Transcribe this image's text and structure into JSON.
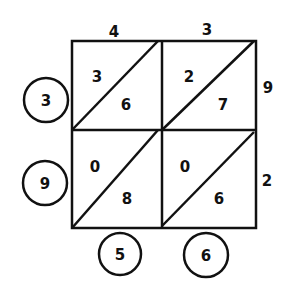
{
  "diagram": {
    "type": "lattice-multiplication",
    "top_digits": [
      "4",
      "3"
    ],
    "left_digits": [
      "3",
      "9"
    ],
    "right_labels": [
      "9",
      "2"
    ],
    "cells": [
      [
        {
          "tens": "3",
          "ones": "6"
        },
        {
          "tens": "2",
          "ones": "7"
        }
      ],
      [
        {
          "tens": "0",
          "ones": "8"
        },
        {
          "tens": "0",
          "ones": "6"
        }
      ]
    ],
    "bottom_digits": [
      "5",
      "6"
    ]
  }
}
